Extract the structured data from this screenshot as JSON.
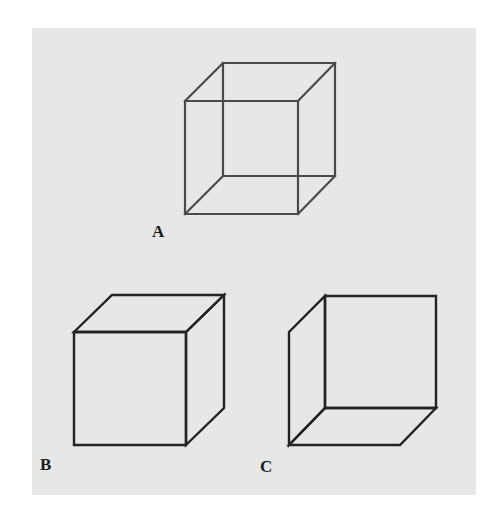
{
  "figure": {
    "colors": {
      "background": "#ffffff",
      "panel": "#e7e7e7",
      "cube_a_lines": "#4a4a4a",
      "cube_bc_lines": "#232323",
      "label_text": "#1a1a1a"
    },
    "cubes": [
      {
        "id": "A",
        "label": "A",
        "description": "ambiguous wireframe cube, all twelve edges drawn"
      },
      {
        "id": "B",
        "label": "B",
        "description": "cube seen from above, front face toward lower-left, hidden edges removed"
      },
      {
        "id": "C",
        "label": "C",
        "description": "cube seen from below, front face toward upper-right, hidden edges removed"
      }
    ]
  }
}
